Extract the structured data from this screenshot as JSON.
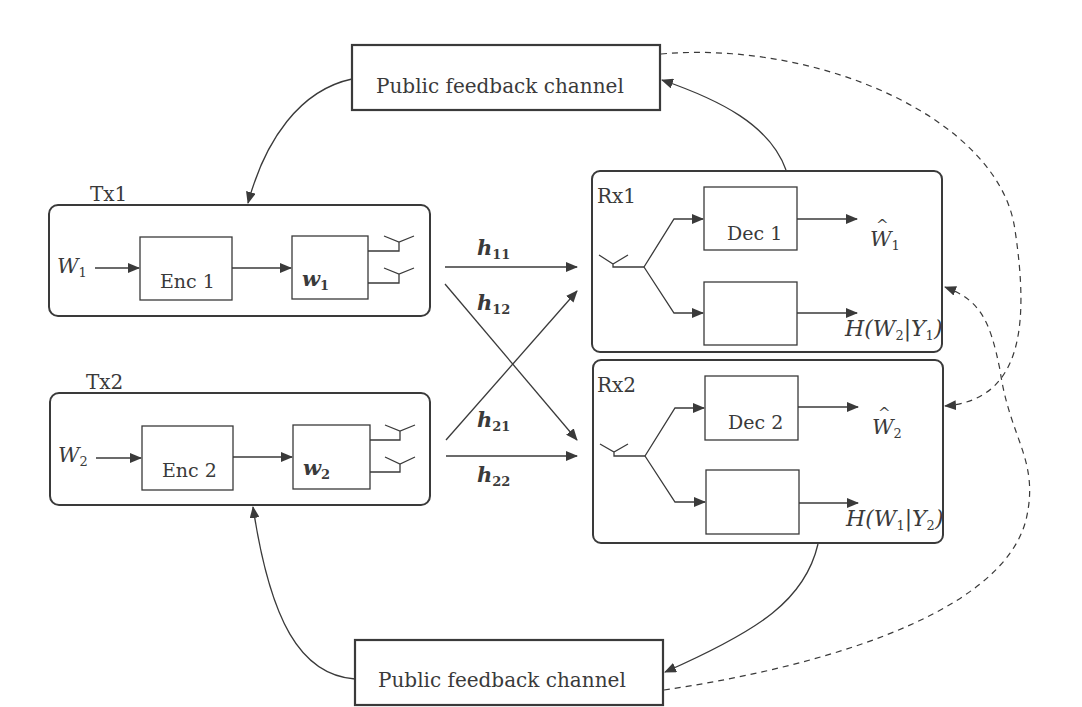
{
  "diagram": {
    "type": "block-diagram",
    "feedback_top": {
      "label": "Public feedback channel"
    },
    "feedback_bottom": {
      "label": "Public feedback channel"
    },
    "tx1": {
      "label": "Tx1",
      "input": "W",
      "input_sub": "1",
      "encoder": "Enc 1",
      "beamformer": "w",
      "beamformer_sub": "1"
    },
    "tx2": {
      "label": "Tx2",
      "input": "W",
      "input_sub": "2",
      "encoder": "Enc 2",
      "beamformer": "w",
      "beamformer_sub": "2"
    },
    "channels": [
      {
        "name": "h",
        "sub": "11"
      },
      {
        "name": "h",
        "sub": "12"
      },
      {
        "name": "h",
        "sub": "21"
      },
      {
        "name": "h",
        "sub": "22"
      }
    ],
    "rx1": {
      "label": "Rx1",
      "decoder": "Dec 1",
      "output": "W",
      "output_sub": "1",
      "entropy": {
        "pre": "H(W",
        "sub1": "2",
        "mid": "|Y",
        "sub2": "1",
        "post": ")"
      }
    },
    "rx2": {
      "label": "Rx2",
      "decoder": "Dec 2",
      "output": "W",
      "output_sub": "2",
      "entropy": {
        "pre": "H(W",
        "sub1": "1",
        "mid": "|Y",
        "sub2": "2",
        "post": ")"
      }
    },
    "colors": {
      "stroke": "#3a3a3a",
      "background": "#ffffff"
    }
  }
}
